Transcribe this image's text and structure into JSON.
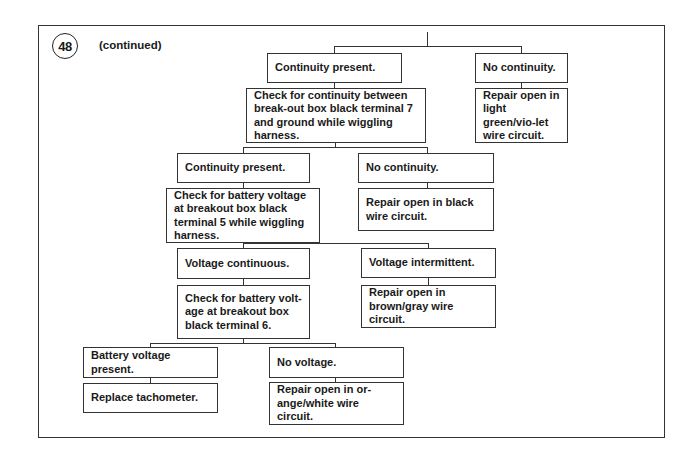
{
  "header": {
    "step_number": "48",
    "continued_label": "(continued)"
  },
  "flowchart": {
    "level1": {
      "left_result": "Continuity present.",
      "right_result": "No continuity.",
      "right_action": "Repair open in light green/vio-let wire circuit.",
      "left_check": "Check for continuity between break-out box black terminal 7 and ground while wiggling harness."
    },
    "level2": {
      "left_result": "Continuity present.",
      "right_result": "No continuity.",
      "right_action": "Repair open in black wire circuit.",
      "left_check": "Check for battery voltage at breakout box black terminal 5 while wiggling harness."
    },
    "level3": {
      "left_result": "Voltage continuous.",
      "right_result": "Voltage intermittent.",
      "right_action": "Repair open in brown/gray wire circuit.",
      "left_check": "Check for battery volt-age at breakout box black terminal 6."
    },
    "level4": {
      "left_result": "Battery voltage present.",
      "left_action": "Replace tachometer.",
      "right_result": "No voltage.",
      "right_action": "Repair open in or-ange/white wire circuit."
    }
  }
}
